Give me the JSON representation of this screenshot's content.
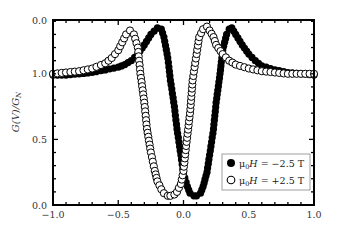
{
  "chart_data": {
    "type": "scatter",
    "title": "",
    "xlabel": "",
    "ylabel": "G(V)/G_N",
    "xlim": [
      -1.0,
      1.0
    ],
    "ylim": [
      0.0,
      1.41
    ],
    "grid": false,
    "legend_position": "lower right",
    "x_ticks": [
      "-1.0",
      "-0.5",
      "0.0",
      "0.5",
      "1.0"
    ],
    "y_ticks": [
      {
        "label": "0.0",
        "value": 0.0
      },
      {
        "label": "0.5",
        "value": 0.5
      },
      {
        "label": "1.0",
        "value": 1.0
      },
      {
        "label": "0.0",
        "value": 1.41
      }
    ],
    "series": [
      {
        "name": "μ0H = −2.5 T",
        "marker": "filled-circle",
        "color": "#000000",
        "x": [
          -1.0,
          -0.9,
          -0.8,
          -0.7,
          -0.6,
          -0.5,
          -0.45,
          -0.4,
          -0.35,
          -0.3,
          -0.25,
          -0.2,
          -0.17,
          -0.15,
          -0.12,
          -0.1,
          -0.07,
          -0.05,
          -0.02,
          0.0,
          0.03,
          0.05,
          0.08,
          0.1,
          0.13,
          0.15,
          0.18,
          0.2,
          0.23,
          0.25,
          0.28,
          0.3,
          0.33,
          0.35,
          0.37,
          0.4,
          0.45,
          0.5,
          0.55,
          0.6,
          0.7,
          0.8,
          0.9,
          1.0
        ],
        "values": [
          0.99,
          0.99,
          1.0,
          1.01,
          1.03,
          1.05,
          1.07,
          1.1,
          1.15,
          1.22,
          1.3,
          1.35,
          1.34,
          1.28,
          1.12,
          0.95,
          0.75,
          0.58,
          0.38,
          0.24,
          0.14,
          0.09,
          0.07,
          0.07,
          0.09,
          0.14,
          0.25,
          0.38,
          0.58,
          0.78,
          1.0,
          1.18,
          1.3,
          1.34,
          1.35,
          1.3,
          1.22,
          1.15,
          1.1,
          1.06,
          1.03,
          1.01,
          1.0,
          0.99
        ]
      },
      {
        "name": "μ0H = +2.5 T",
        "marker": "open-circle",
        "color": "#000000",
        "x": [
          -1.0,
          -0.9,
          -0.8,
          -0.7,
          -0.6,
          -0.55,
          -0.5,
          -0.47,
          -0.44,
          -0.41,
          -0.38,
          -0.35,
          -0.33,
          -0.3,
          -0.28,
          -0.25,
          -0.22,
          -0.2,
          -0.17,
          -0.15,
          -0.12,
          -0.1,
          -0.07,
          -0.05,
          -0.02,
          0.0,
          0.02,
          0.05,
          0.07,
          0.1,
          0.12,
          0.15,
          0.18,
          0.2,
          0.23,
          0.25,
          0.3,
          0.35,
          0.4,
          0.5,
          0.6,
          0.7,
          0.8,
          0.9,
          1.0
        ],
        "values": [
          1.0,
          1.01,
          1.02,
          1.04,
          1.08,
          1.12,
          1.18,
          1.24,
          1.3,
          1.33,
          1.3,
          1.2,
          1.0,
          0.78,
          0.58,
          0.4,
          0.26,
          0.18,
          0.12,
          0.09,
          0.07,
          0.07,
          0.08,
          0.1,
          0.16,
          0.26,
          0.45,
          0.7,
          0.95,
          1.15,
          1.28,
          1.34,
          1.36,
          1.33,
          1.28,
          1.22,
          1.15,
          1.1,
          1.07,
          1.04,
          1.02,
          1.01,
          1.0,
          1.0,
          1.0
        ]
      }
    ]
  },
  "legend": {
    "items": [
      {
        "label_prefix": "μ",
        "label_sub": "0",
        "label_italic": "H",
        "label_suffix": " = −2.5 T",
        "marker": "filled"
      },
      {
        "label_prefix": "μ",
        "label_sub": "0",
        "label_italic": "H",
        "label_suffix": " = +2.5 T",
        "marker": "open"
      }
    ]
  },
  "axes": {
    "ylabel_main": "G(V)/G",
    "ylabel_sub": "N"
  }
}
